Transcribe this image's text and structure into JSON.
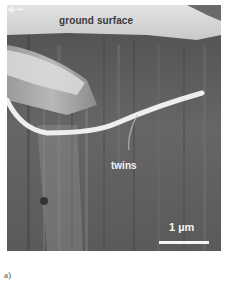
{
  "figure": {
    "panel_label": "a)",
    "labels": {
      "ground_surface": "ground surface",
      "twins": "twins"
    },
    "scale_bar": {
      "text": "1 µm",
      "color": "#f5f5f5"
    },
    "colors": {
      "top_region": "#d8d8d8",
      "body_dark": "#5e5e5e",
      "white_band": "#eeeeee"
    }
  }
}
